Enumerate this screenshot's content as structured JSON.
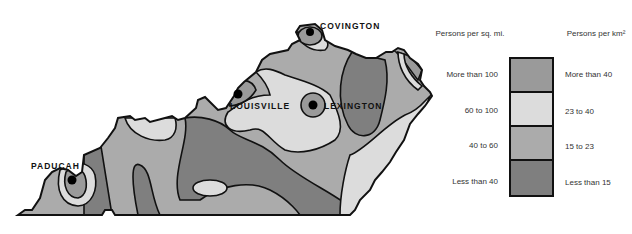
{
  "cities": [
    {
      "name": "COVINGTON",
      "x": 320,
      "y": 30
    },
    {
      "name": "LOUISVILLE",
      "x": 230,
      "y": 104
    },
    {
      "name": "LEXINGTON",
      "x": 324,
      "y": 104
    },
    {
      "name": "PADUCAH",
      "x": 31,
      "y": 156
    }
  ],
  "legend": {
    "left_header": "Persons per sq. mi.",
    "right_header": "Persons per km²",
    "classes": [
      {
        "sq_mi": "More than 100",
        "km2": "More than 40",
        "color": "#9a9a9a"
      },
      {
        "sq_mi": "60 to 100",
        "km2": "23 to 40",
        "color": "#dcdcdc"
      },
      {
        "sq_mi": "40 to 60",
        "km2": "15 to 23",
        "color": "#ababab"
      },
      {
        "sq_mi": "Less than 40",
        "km2": "Less than 15",
        "color": "#7f7f7f"
      }
    ]
  }
}
